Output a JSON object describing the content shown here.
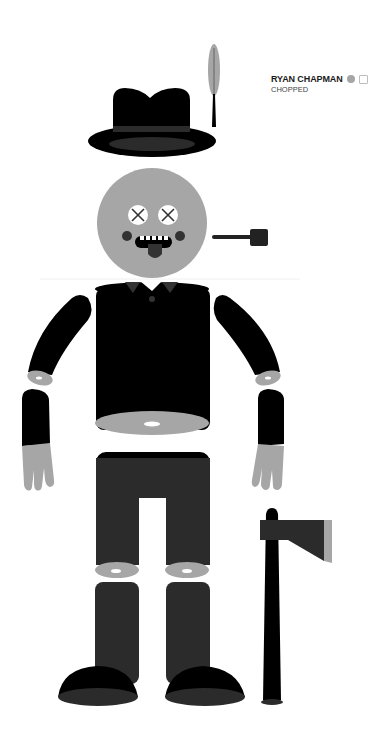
{
  "caption": {
    "name": "RYAN CHAPMAN",
    "title": "CHOPPED",
    "icons": [
      "circle-icon",
      "square-icon"
    ]
  },
  "illustration": {
    "subject": "lumberjack figure",
    "parts": [
      "feather",
      "fedora-hat",
      "head",
      "pipe",
      "torso",
      "left-upper-arm",
      "right-upper-arm",
      "left-forearm",
      "right-forearm",
      "pants",
      "left-shin",
      "right-shin",
      "left-boot",
      "right-boot",
      "axe"
    ],
    "colors": {
      "black": "#000000",
      "dark_gray": "#2b2b2b",
      "mid_gray": "#a6a6a6",
      "white": "#ffffff"
    }
  }
}
